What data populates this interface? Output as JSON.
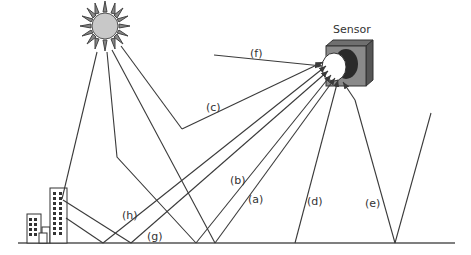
{
  "diagram": {
    "type": "remote-sensing radiation paths",
    "sensor_label": "Sensor",
    "path_labels": {
      "a": "(a)",
      "b": "(b)",
      "c": "(c)",
      "d": "(d)",
      "e": "(e)",
      "f": "(f)",
      "g": "(g)",
      "h": "(h)"
    },
    "elements": [
      "sun",
      "sensor",
      "buildings",
      "ground"
    ],
    "colors": {
      "line": "#3a3a3a",
      "sun_fill": "#c8c8c8",
      "sensor_body": "#8a8a8a",
      "sensor_lens_dark": "#2a2a2a",
      "sensor_lens": "#ffffff"
    }
  }
}
